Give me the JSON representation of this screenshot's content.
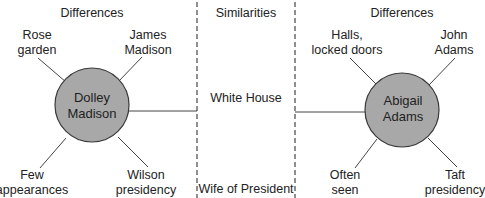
{
  "diagram": {
    "type": "double-bubble-map",
    "colors": {
      "circle_fill": "#a8a8a8",
      "circle_stroke": "#3a3a3a",
      "line": "#444444",
      "text": "#222222"
    },
    "left": {
      "header": "Differences",
      "center": {
        "line1": "Dolley",
        "line2": "Madison"
      },
      "attributes": [
        {
          "line1": "Rose",
          "line2": "garden"
        },
        {
          "line1": "James",
          "line2": "Madison"
        },
        {
          "line1": "Few",
          "line2": "appearances"
        },
        {
          "line1": "Wilson",
          "line2": "presidency"
        }
      ]
    },
    "middle": {
      "header": "Similarities",
      "items": [
        "White House",
        "Wife of President"
      ]
    },
    "right": {
      "header": "Differences",
      "center": {
        "line1": "Abigail",
        "line2": "Adams"
      },
      "attributes": [
        {
          "line1": "Halls,",
          "line2": "locked doors"
        },
        {
          "line1": "John",
          "line2": "Adams"
        },
        {
          "line1": "Often",
          "line2": "seen"
        },
        {
          "line1": "Taft",
          "line2": "presidency"
        }
      ]
    }
  }
}
